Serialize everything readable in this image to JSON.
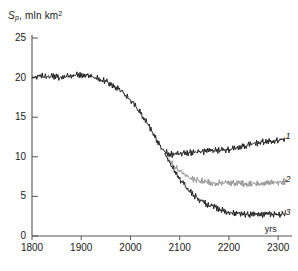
{
  "chart_data": {
    "type": "line",
    "title": "",
    "subtitle": "",
    "ylabel": "S_p, mln km2",
    "ylabel_parts": {
      "symbol": "S",
      "subscript": "p",
      "sep": ", ",
      "units": "mln km",
      "unit_sup": "2"
    },
    "xlabel": "yrs",
    "xlim": [
      1800,
      2320
    ],
    "ylim": [
      0,
      25
    ],
    "xticks": [
      1800,
      1900,
      2000,
      2100,
      2200,
      2300
    ],
    "yticks": [
      0,
      5,
      10,
      15,
      20,
      25
    ],
    "grid": false,
    "legend_position": "right-inline",
    "legend": [
      {
        "name": "1",
        "color": "#1a1a1a"
      },
      {
        "name": "2",
        "color": "#8f8f8f"
      },
      {
        "name": "3",
        "color": "#1a1a1a"
      }
    ],
    "annotations": [
      {
        "text": "1",
        "x": 2315,
        "y": 12.4
      },
      {
        "text": "2",
        "x": 2315,
        "y": 6.9
      },
      {
        "text": "3",
        "x": 2315,
        "y": 2.8
      },
      {
        "text": "yrs",
        "x": 2285,
        "y": 0.6
      }
    ],
    "noise_amplitude": 0.45,
    "series": [
      {
        "name": "1",
        "color": "#1a1a1a",
        "x": [
          1800,
          1820,
          1840,
          1860,
          1880,
          1900,
          1920,
          1940,
          1960,
          1980,
          2000,
          2020,
          2040,
          2050,
          2060,
          2070,
          2080,
          2090,
          2100,
          2120,
          2140,
          2160,
          2180,
          2200,
          2220,
          2240,
          2260,
          2280,
          2300,
          2315
        ],
        "y": [
          20.0,
          20.2,
          20.1,
          20.0,
          20.2,
          20.4,
          20.2,
          19.8,
          19.2,
          18.4,
          17.2,
          15.6,
          13.6,
          12.4,
          11.4,
          10.6,
          10.3,
          10.3,
          10.4,
          10.5,
          10.6,
          10.7,
          10.8,
          10.9,
          11.2,
          11.5,
          11.8,
          12.0,
          12.1,
          12.2
        ]
      },
      {
        "name": "2",
        "color": "#8f8f8f",
        "x": [
          2070,
          2080,
          2090,
          2100,
          2110,
          2120,
          2130,
          2140,
          2160,
          2180,
          2200,
          2220,
          2240,
          2260,
          2280,
          2300,
          2315
        ],
        "y": [
          10.4,
          9.4,
          8.8,
          8.2,
          7.7,
          7.3,
          7.1,
          7.0,
          6.8,
          6.7,
          6.7,
          6.6,
          6.6,
          6.6,
          6.7,
          6.8,
          6.9
        ]
      },
      {
        "name": "3",
        "color": "#1a1a1a",
        "x": [
          2070,
          2080,
          2090,
          2100,
          2110,
          2120,
          2130,
          2140,
          2150,
          2160,
          2180,
          2200,
          2220,
          2240,
          2260,
          2280,
          2300,
          2315
        ],
        "y": [
          10.4,
          9.2,
          8.2,
          7.2,
          6.4,
          5.7,
          5.1,
          4.6,
          4.2,
          3.9,
          3.4,
          3.0,
          2.8,
          2.7,
          2.7,
          2.7,
          2.7,
          2.8
        ]
      }
    ]
  },
  "axis": {
    "y_tick_labels": [
      "0",
      "5",
      "10",
      "15",
      "20",
      "25"
    ],
    "x_tick_labels": [
      "1800",
      "1900",
      "2000",
      "2100",
      "2200",
      "2300"
    ],
    "x_unit_label": "yrs"
  },
  "labels": {
    "curve1": "1",
    "curve2": "2",
    "curve3": "3"
  }
}
